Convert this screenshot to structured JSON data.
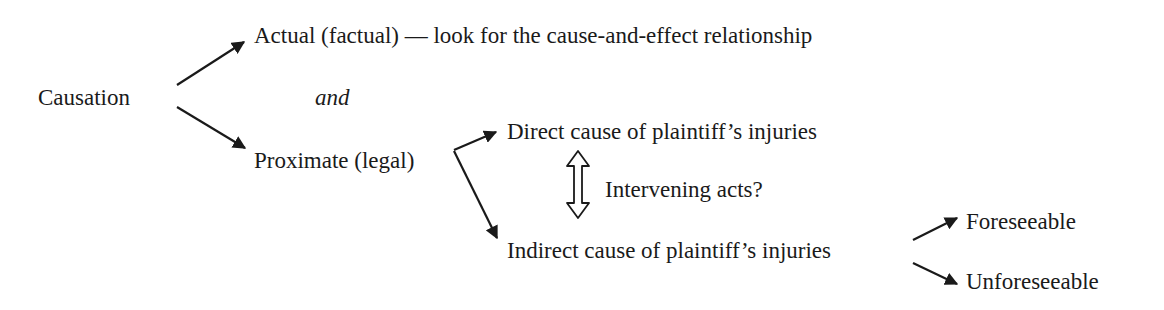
{
  "diagram": {
    "root": "Causation",
    "connector": "and",
    "actual": "Actual (factual) — look for the cause-and-effect relationship",
    "proximate": "Proximate (legal)",
    "direct": "Direct cause of plaintiff’s injuries",
    "intervening": "Intervening acts?",
    "indirect": "Indirect cause of plaintiff’s injuries",
    "foreseeable": "Foreseeable",
    "unforeseeable": "Unforeseeable"
  },
  "edges": [
    {
      "from": "Causation",
      "to": "Actual (factual)"
    },
    {
      "from": "Causation",
      "to": "Proximate (legal)"
    },
    {
      "from": "Proximate (legal)",
      "to": "Direct cause of plaintiff's injuries"
    },
    {
      "from": "Proximate (legal)",
      "to": "Indirect cause of plaintiff's injuries"
    },
    {
      "from": "Direct cause of plaintiff's injuries",
      "to": "Indirect cause of plaintiff's injuries",
      "label": "Intervening acts?",
      "bidirectional": true
    },
    {
      "from": "Indirect cause of plaintiff's injuries",
      "to": "Foreseeable"
    },
    {
      "from": "Indirect cause of plaintiff's injuries",
      "to": "Unforeseeable"
    }
  ]
}
